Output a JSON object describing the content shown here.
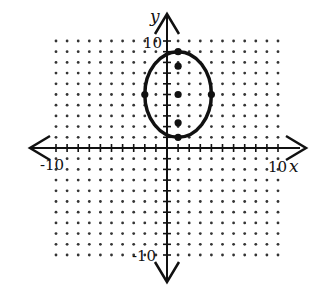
{
  "chart_data": {
    "type": "scatter",
    "title": "",
    "xlabel": "x",
    "ylabel": "y",
    "xlim": [
      -10,
      10
    ],
    "ylim": [
      -10,
      10
    ],
    "grid": "dotted",
    "tick_labels": {
      "x_min": "-10",
      "x_max": "10",
      "y_max": "10",
      "y_min": "-10"
    },
    "ellipse": {
      "center": [
        1,
        5
      ],
      "semi_axis_x": 3,
      "semi_axis_y": 4
    },
    "points": [
      {
        "x": 1,
        "y": 9,
        "label": "vertex"
      },
      {
        "x": 1,
        "y": 7.65,
        "label": "focus"
      },
      {
        "x": 1,
        "y": 5,
        "label": "center"
      },
      {
        "x": 1,
        "y": 2.35,
        "label": "focus"
      },
      {
        "x": 1,
        "y": 1,
        "label": "vertex"
      },
      {
        "x": -2,
        "y": 5,
        "label": "co-vertex"
      },
      {
        "x": 4,
        "y": 5,
        "label": "co-vertex"
      }
    ]
  },
  "labels": {
    "x_axis": "x",
    "y_axis": "y",
    "x_min": "-10",
    "x_max": "10",
    "y_max": "10",
    "y_min": "-10"
  }
}
